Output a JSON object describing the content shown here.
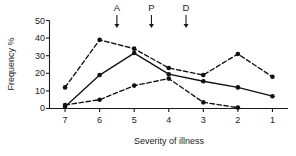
{
  "chart_data": {
    "type": "line",
    "title": "",
    "xlabel": "Severity of illness",
    "ylabel": "Frequency %",
    "categories": [
      "7",
      "6",
      "5",
      "4",
      "3",
      "2",
      "1"
    ],
    "x": [
      7,
      6,
      5,
      4,
      3,
      2,
      1
    ],
    "xlim": [
      7.45,
      0.55
    ],
    "ylim": [
      0,
      50
    ],
    "yticks": [
      0,
      10,
      20,
      30,
      40,
      50
    ],
    "xticks": [
      7,
      6,
      5,
      4,
      3,
      2,
      1
    ],
    "grid": false,
    "legend": "none",
    "x_axis_direction": "descending",
    "series": [
      {
        "name": "series-1",
        "style": "dashed",
        "marker": "filled-circle",
        "values": [
          12,
          39,
          34,
          23,
          19,
          31,
          18
        ]
      },
      {
        "name": "series-2",
        "style": "solid",
        "marker": "filled-circle",
        "values": [
          1,
          19,
          31.5,
          19.5,
          15.5,
          12,
          7
        ]
      },
      {
        "name": "series-3",
        "style": "dashed",
        "marker": "filled-circle",
        "values": [
          2,
          5,
          13,
          17,
          3.5,
          0.5,
          null
        ]
      }
    ],
    "annotations": [
      {
        "label": "A",
        "x": 5.5,
        "type": "down-arrow"
      },
      {
        "label": "P",
        "x": 4.5,
        "type": "down-arrow"
      },
      {
        "label": "D",
        "x": 3.5,
        "type": "down-arrow"
      }
    ]
  },
  "axes": {
    "y_tick_labels": [
      "50",
      "40",
      "30",
      "20",
      "10",
      "0"
    ],
    "x_tick_labels": [
      "7",
      "6",
      "5",
      "4",
      "3",
      "2",
      "1"
    ],
    "y_title": "Frequency %",
    "x_title": "Severity of illness"
  },
  "colors": {
    "ink": "#111111",
    "background": "#ffffff"
  }
}
